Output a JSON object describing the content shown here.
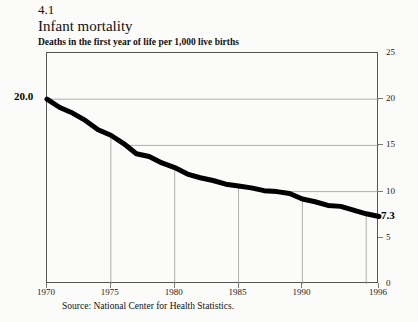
{
  "header": {
    "figure_number": "4.1",
    "title": "Infant mortality",
    "subtitle": "Deaths in the first year of life per 1,000 live births"
  },
  "source": "Source: National Center for Health Statistics.",
  "labels": {
    "start_value": "20.0",
    "end_value": "7.3"
  },
  "chart_data": {
    "type": "line",
    "title": "Infant mortality",
    "subtitle": "Deaths in the first year of life per 1,000 live births",
    "xlabel": "",
    "ylabel": "",
    "xlim": [
      1970,
      1996
    ],
    "ylim": [
      0,
      25
    ],
    "yticks": [
      0,
      5,
      10,
      15,
      20,
      25
    ],
    "ytick_labels": [
      "0",
      "5",
      "10",
      "15",
      "20",
      "25"
    ],
    "y_axis_position": "right",
    "xticks": [
      1970,
      1975,
      1980,
      1985,
      1990,
      1996
    ],
    "xtick_labels": [
      "1970",
      "1975",
      "1980",
      "1985",
      "1990",
      "1996"
    ],
    "grid": "clipped-to-line",
    "gridlines_horizontal": [
      20,
      15,
      10
    ],
    "gridlines_vertical": [
      1975,
      1980,
      1985,
      1990,
      1995
    ],
    "legend": "none",
    "line_color": "#000000",
    "line_width_px": 5,
    "annotations": [
      {
        "x": 1970,
        "y": 20.0,
        "text": "20.0"
      },
      {
        "x": 1996,
        "y": 7.3,
        "text": "7.3"
      }
    ],
    "x": [
      1970,
      1971,
      1972,
      1973,
      1974,
      1975,
      1976,
      1977,
      1978,
      1979,
      1980,
      1981,
      1982,
      1983,
      1984,
      1985,
      1986,
      1987,
      1988,
      1989,
      1990,
      1991,
      1992,
      1993,
      1994,
      1995,
      1996
    ],
    "values": [
      20.0,
      19.1,
      18.5,
      17.7,
      16.7,
      16.1,
      15.2,
      14.1,
      13.8,
      13.1,
      12.6,
      11.9,
      11.5,
      11.2,
      10.8,
      10.6,
      10.4,
      10.1,
      10.0,
      9.8,
      9.2,
      8.9,
      8.5,
      8.4,
      8.0,
      7.6,
      7.3
    ]
  }
}
